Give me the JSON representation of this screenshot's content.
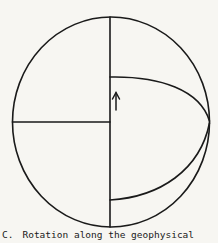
{
  "figure": {
    "stroke_color": "#1a1a1a",
    "background_color": "#f7f6f2",
    "arrow_direction": "up"
  },
  "caption": {
    "label": "C.",
    "text": "Rotation along the geophysical"
  }
}
